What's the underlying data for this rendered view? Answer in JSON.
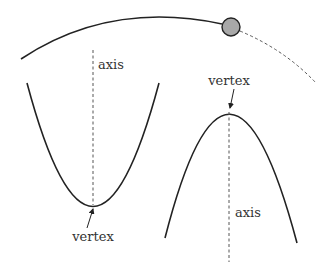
{
  "diagram": {
    "colors": {
      "curve": "#222222",
      "dash": "#555555",
      "ball_fill": "#a8a8a8",
      "ball_stroke": "#222222",
      "text": "#333333"
    },
    "trajectory": {
      "ball": "projectile-ball"
    },
    "left_parabola": {
      "axis_label": "axis",
      "vertex_label": "vertex",
      "opens": "up"
    },
    "right_parabola": {
      "axis_label": "axis",
      "vertex_label": "vertex",
      "opens": "down"
    }
  }
}
